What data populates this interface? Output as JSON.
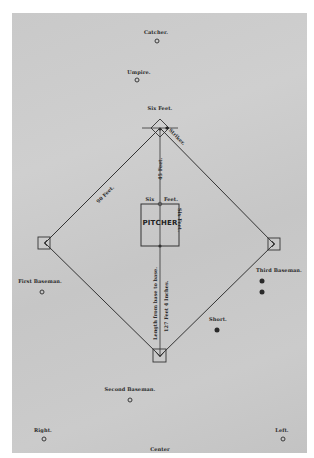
{
  "diagram": {
    "type": "baseball-field-layout",
    "positions": {
      "catcher": "Catcher.",
      "umpire": "Umpire.",
      "first_baseman": "First Baseman.",
      "third_baseman": "Third Baseman.",
      "short": "Short.",
      "second_baseman": "Second Baseman.",
      "right": "Right.",
      "left": "Left.",
      "center": "Center"
    },
    "measurements": {
      "home_plate_box": "Six Feet.",
      "striker": "Striker.",
      "base_line": "90 Feet.",
      "home_to_pitcher": "45 Feet.",
      "pitcher_box_width_left": "Six",
      "pitcher_box_width_right": "Feet.",
      "pitcher_box_depth": "Six Feet.",
      "home_to_second_label": "Length from base to base.",
      "home_to_second_value": "127 Feet 4 Inches."
    },
    "pitcher_box_label": "PITCHER",
    "colors": {
      "paper": "#c9c9c9",
      "ink": "#2a2a2a",
      "background": "#ffffff"
    }
  }
}
